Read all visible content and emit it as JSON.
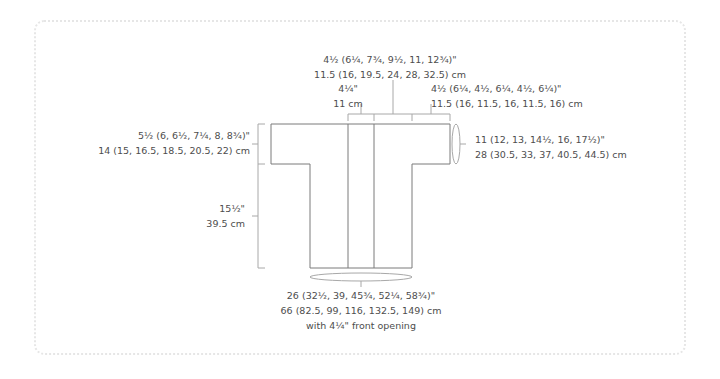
{
  "diagram": {
    "type": "garment-schematic",
    "line_color": "#7a7a7a",
    "guide_color": "#a8a8a8",
    "text_color": "#4d4d4d",
    "border_color": "#e6e6e6"
  },
  "labels": {
    "neck_total": {
      "imperial": "4½ (6¼, 7¾, 9½, 11, 12¾)\"",
      "metric": "11.5 (16, 19.5, 24, 28, 32.5) cm"
    },
    "front_opening_top": {
      "imperial": "4¼\"",
      "metric": "11 cm"
    },
    "shoulder": {
      "imperial": "4½ (6¼, 4½, 6¼, 4½, 6¼)\"",
      "metric": "11.5 (16, 11.5, 16, 11.5, 16) cm"
    },
    "sleeve_depth": {
      "imperial": "5½ (6, 6½, 7¼, 8, 8¾)\"",
      "metric": "14 (15, 16.5, 18.5, 20.5, 22) cm"
    },
    "sleeve_circumference": {
      "imperial": "11 (12, 13, 14½, 16, 17½)\"",
      "metric": "28 (30.5, 33, 37, 40.5, 44.5) cm"
    },
    "body_length": {
      "imperial": "15½\"",
      "metric": "39.5 cm"
    },
    "hem_circumference": {
      "imperial": "26 (32½, 39, 45¾, 52¼, 58¾)\"",
      "metric": "66 (82.5, 99, 116, 132.5, 149) cm",
      "note": "with 4¼\" front opening"
    }
  }
}
